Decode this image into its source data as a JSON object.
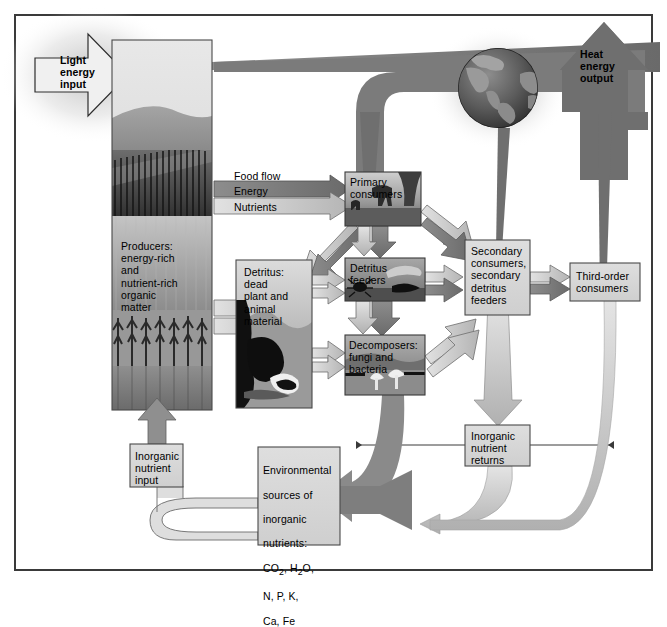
{
  "figure": {
    "kind": "ecosystem-energy-and-nutrient-flow-diagram",
    "frame_border_color": "#3a3a3a",
    "background": "#ffffff"
  },
  "colors": {
    "energy_dark": "#6e6e6e",
    "energy_mid": "#8c8c8c",
    "nutrient_light": "#c9c9c9",
    "box_fill": "#d6d6d6",
    "box_stroke": "#4a4a4a",
    "photo_dark": "#5f5f5f",
    "globe_dark": "#4d4d4d",
    "globe_land": "#9b9b9b",
    "text": "#000000"
  },
  "inputs": {
    "light_energy": "Light\nenergy\ninput",
    "heat_energy": "Heat\nenergy\noutput"
  },
  "legend": {
    "title": "Food flow",
    "items": [
      {
        "label": "Food flow",
        "key": "food-flow",
        "color": "#6e6e6e"
      },
      {
        "label": "Energy",
        "key": "energy",
        "color": "#7a7a7a"
      },
      {
        "label": "Nutrients",
        "key": "nutrients",
        "color": "#c9c9c9"
      }
    ]
  },
  "boxes": {
    "producers": "Producers:\nenergy-rich\nand\nnutrient-rich\norganic\nmatter",
    "detritus": "Detritus:\ndead\nplant and\nanimal\nmaterial",
    "primary_consumers": "Primary\nconsumers",
    "detritus_feeders": "Detritus\nfeeders",
    "decomposers": "Decomposers:\nfungi and\nbacteria",
    "secondary_consumers": "Secondary\nconsumers,\nsecondary\ndetritus\nfeeders",
    "third_order_consumers": "Third-order\nconsumers",
    "inorganic_nutrient_input": "Inorganic\nnutrient\ninput",
    "inorganic_nutrient_returns": "Inorganic\nnutrient\nreturns",
    "environmental_sources": "Environmental\nsources of\ninorganic\nnutrients:\nCO2, H2O,\nN, P, K,\nCa, Fe"
  },
  "environmental_sources_lines": [
    "Environmental",
    "sources of",
    "inorganic",
    "nutrients:",
    "CO",
    "2",
    ", H",
    "2",
    "O,",
    "N, P, K,",
    "Ca, Fe"
  ],
  "icons": {
    "globe": "globe-icon",
    "light_arrow": "light-energy-arrow-icon",
    "heat_arrow": "heat-energy-arrow-icon"
  }
}
